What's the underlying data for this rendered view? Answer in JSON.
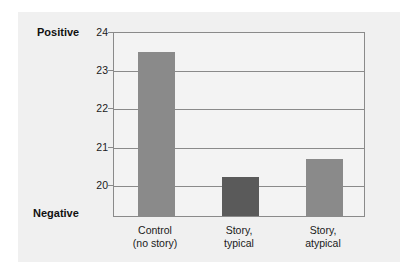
{
  "chart_data": {
    "type": "bar",
    "title": "",
    "xlabel": "",
    "ylabel": "",
    "ylim": [
      19.16,
      24
    ],
    "grid": true,
    "legend": false,
    "categories": [
      "Control\n(no story)",
      "Story,\ntypical",
      "Story,\natypical"
    ],
    "category_lines": [
      [
        "Control",
        "(no story)"
      ],
      [
        "Story,",
        "typical"
      ],
      [
        "Story,",
        "atypical"
      ]
    ],
    "values": [
      23.45,
      20.18,
      20.66
    ],
    "yticks": [
      24,
      23,
      22,
      21,
      20
    ],
    "ytick_labels": [
      "24",
      "23",
      "22",
      "21",
      "20"
    ],
    "axis_endpoint_labels": {
      "top": "Positive",
      "bottom": "Negative"
    },
    "bar_colors": [
      "#8a8a8a",
      "#5a5a5a",
      "#8a8a8a"
    ],
    "colors": {
      "panel_background": "#f0f0f0",
      "plot_background": "#f3f3f3",
      "axis": "#8a8a8a",
      "gridline": "#8a8a8a",
      "text": "#1a1a1a"
    }
  }
}
